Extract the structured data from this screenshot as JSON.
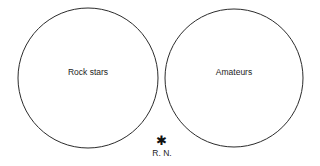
{
  "canvas": {
    "width": 320,
    "height": 166,
    "background_color": "#ffffff",
    "stroke_color": "#2b2b2b",
    "text_color": "#1c1c1c"
  },
  "diagram": {
    "type": "two-set-disjoint-venn",
    "sets": [
      {
        "id": "rock-stars",
        "label": "Rock stars",
        "center_x": 88,
        "center_y": 78,
        "radius": 70,
        "label_x": 88,
        "label_y": 73
      },
      {
        "id": "amateurs",
        "label": "Amateurs",
        "center_x": 234,
        "center_y": 78,
        "radius": 69,
        "label_x": 234,
        "label_y": 73
      }
    ],
    "intersection": "none"
  },
  "footnote": {
    "marker_icon": "asterisk-icon",
    "marker_glyph": "✱",
    "marker_x": 161,
    "marker_y": 143,
    "credit": "R. N.",
    "credit_x": 162,
    "credit_y": 155
  }
}
